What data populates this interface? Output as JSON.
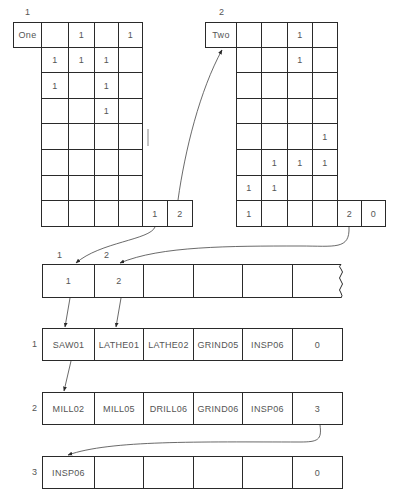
{
  "matrices": [
    {
      "id": "1",
      "name": "One",
      "label": "1",
      "rows": [
        [
          "",
          "1",
          "",
          "1"
        ],
        [
          "1",
          "1",
          "1",
          ""
        ],
        [
          "1",
          "",
          "1",
          ""
        ],
        [
          "",
          "",
          "1",
          ""
        ],
        [
          "",
          "",
          "",
          ""
        ],
        [
          "",
          "",
          "",
          ""
        ],
        [
          "",
          "",
          "",
          ""
        ],
        [
          "",
          "",
          "",
          ""
        ]
      ],
      "pointer_cells": [
        "1",
        "2"
      ]
    },
    {
      "id": "2",
      "name": "Two",
      "label": "2",
      "rows": [
        [
          "",
          "",
          "1",
          ""
        ],
        [
          "",
          "",
          "1",
          ""
        ],
        [
          "",
          "",
          "",
          ""
        ],
        [
          "",
          "",
          "",
          ""
        ],
        [
          "",
          "",
          "",
          "1"
        ],
        [
          "",
          "1",
          "1",
          "1"
        ],
        [
          "1",
          "1",
          "",
          ""
        ],
        [
          "1",
          "",
          "",
          ""
        ]
      ],
      "pointer_cells": [
        "2",
        "0"
      ]
    }
  ],
  "index_array": {
    "column_labels": [
      "1",
      "2"
    ],
    "cells": [
      "1",
      "2",
      "",
      "",
      "",
      ""
    ]
  },
  "routing_records": [
    {
      "label": "1",
      "cells": [
        "SAW01",
        "LATHE01",
        "LATHE02",
        "GRIND05",
        "INSP06",
        "0"
      ]
    },
    {
      "label": "2",
      "cells": [
        "MILL02",
        "MILL05",
        "DRILL06",
        "GRIND06",
        "INSP06",
        "3"
      ]
    },
    {
      "label": "3",
      "cells": [
        "INSP06",
        "",
        "",
        "",
        "",
        "0"
      ]
    }
  ],
  "colors": {
    "line": "#2a2a2a",
    "text": "#555555",
    "background": "#ffffff"
  }
}
